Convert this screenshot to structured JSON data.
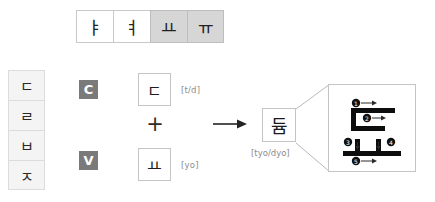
{
  "vowel_strip": {
    "name": "hangul-vowel-row",
    "cells": [
      {
        "glyph": "ㅑ",
        "selected": false
      },
      {
        "glyph": "ㅕ",
        "selected": false
      },
      {
        "glyph": "ㅛ",
        "selected": true
      },
      {
        "glyph": "ㅠ",
        "selected": true
      }
    ]
  },
  "consonant_column": {
    "name": "hangul-consonant-column",
    "cells": [
      {
        "glyph": "ㄷ"
      },
      {
        "glyph": "ㄹ"
      },
      {
        "glyph": "ㅂ"
      },
      {
        "glyph": "ㅈ"
      }
    ]
  },
  "equation": {
    "consonant_badge": "C",
    "vowel_badge": "V",
    "consonant_glyph": "ㄷ",
    "consonant_romanization": "[t/d]",
    "vowel_glyph": "ㅛ",
    "vowel_romanization": "[yo]",
    "operator": "+",
    "arrow": "→"
  },
  "result": {
    "syllable": "듐",
    "romanization": "[tyo/dyo]"
  },
  "stroke_order": {
    "title": "stroke-order-detail",
    "total_strokes": 5,
    "markers": [
      {
        "number": "1",
        "x": 27,
        "y": 18
      },
      {
        "number": "2",
        "x": 38,
        "y": 33
      },
      {
        "number": "3",
        "x": 23,
        "y": 55
      },
      {
        "number": "4",
        "x": 64,
        "y": 55
      },
      {
        "number": "5",
        "x": 27,
        "y": 74
      }
    ]
  },
  "colors": {
    "highlight": "#d6d6d6",
    "badge_bg": "#7a7a7a",
    "cell_bg": "#f4f4f4",
    "border": "#c4c4c4",
    "ink": "#1d1d1d",
    "label": "#8d8d8d"
  }
}
